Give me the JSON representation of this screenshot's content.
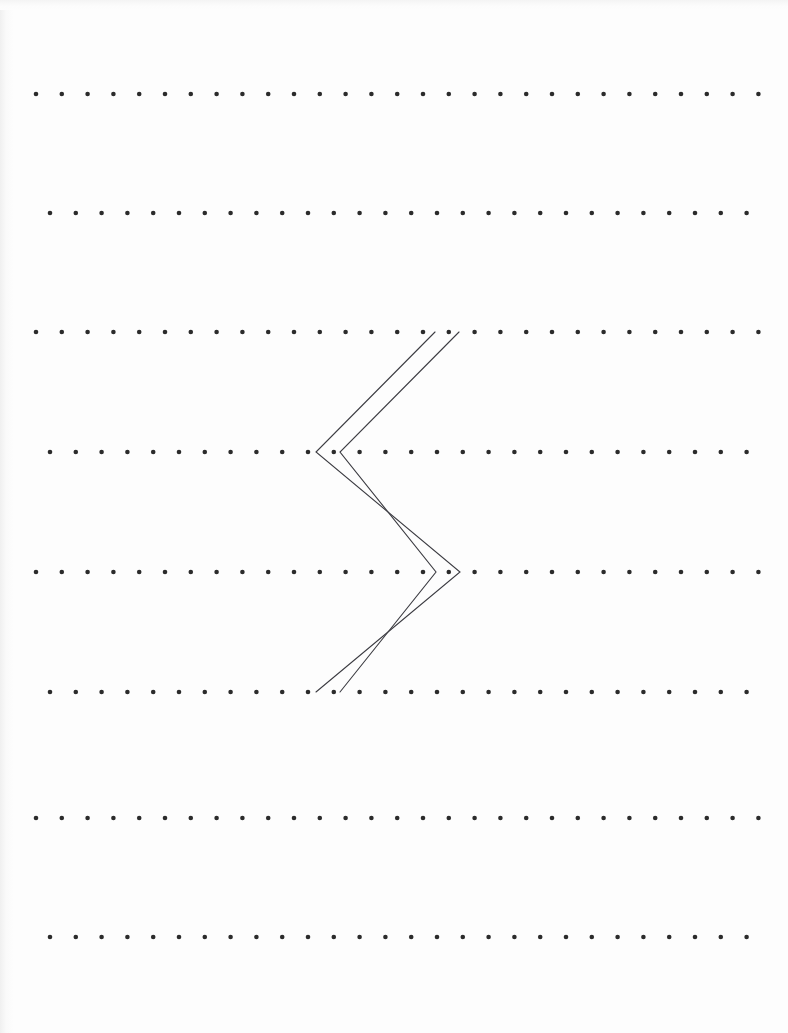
{
  "document": {
    "title": "Dot Grid Worksheet",
    "page_width": 788,
    "page_height": 1033,
    "background_color": "#fdfdfd",
    "paper_edge_shadow": true
  },
  "dot_grid": {
    "name": "dot-grid",
    "description": "Eight horizontal rows of evenly spaced round dots, alternating rows offset horizontally by half a column",
    "dot_color": "#2b2b2b",
    "dot_radius": 2.3,
    "row_count": 8,
    "column_spacing": 25.8,
    "rows": [
      {
        "index": 1,
        "y": 94,
        "x_start": 36,
        "dot_count": 29
      },
      {
        "index": 2,
        "y": 213,
        "x_start": 50,
        "dot_count": 28
      },
      {
        "index": 3,
        "y": 332,
        "x_start": 36,
        "dot_count": 29
      },
      {
        "index": 4,
        "y": 452,
        "x_start": 50,
        "dot_count": 28
      },
      {
        "index": 5,
        "y": 572,
        "x_start": 36,
        "dot_count": 29
      },
      {
        "index": 6,
        "y": 692,
        "x_start": 50,
        "dot_count": 28
      },
      {
        "index": 7,
        "y": 818,
        "x_start": 36,
        "dot_count": 29
      },
      {
        "index": 8,
        "y": 937,
        "x_start": 50,
        "dot_count": 28
      }
    ]
  },
  "figure": {
    "name": "double-chevron-zigzag",
    "stroke_color": "#3c3c42",
    "stroke_width": 1.1,
    "polylines": [
      {
        "id": "outer-zigzag",
        "points": [
          {
            "x": 435,
            "y": 332
          },
          {
            "x": 316,
            "y": 452
          },
          {
            "x": 460,
            "y": 572
          },
          {
            "x": 316,
            "y": 692
          }
        ]
      },
      {
        "id": "inner-zigzag",
        "points": [
          {
            "x": 459,
            "y": 332
          },
          {
            "x": 340,
            "y": 452
          },
          {
            "x": 436,
            "y": 572
          },
          {
            "x": 340,
            "y": 692
          }
        ]
      }
    ]
  }
}
